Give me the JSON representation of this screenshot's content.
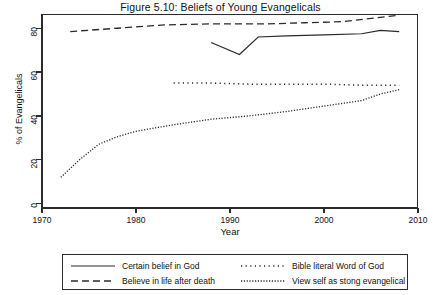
{
  "figure": {
    "title": "Figure 5.10: Beliefs of Young Evangelicals"
  },
  "axes": {
    "xlabel": "Year",
    "ylabel": "% of Evangelicals",
    "xticks": [
      "1970",
      "1980",
      "1990",
      "2000",
      "2010"
    ],
    "yticks": [
      "0",
      "20",
      "40",
      "60",
      "80"
    ]
  },
  "legend": {
    "entries": [
      {
        "label": "Certain belief in God",
        "style": "solid"
      },
      {
        "label": "Believe in life after death",
        "style": "dashed"
      },
      {
        "label": "Bible literal Word of God",
        "style": "sparse-dotted"
      },
      {
        "label": "View self as stong evangelical",
        "style": "dense-dotted"
      }
    ]
  },
  "chart_data": {
    "type": "line",
    "title": "Figure 5.10: Beliefs of Young Evangelicals",
    "xlabel": "Year",
    "ylabel": "% of Evangelicals",
    "xlim": [
      1970,
      2010
    ],
    "ylim": [
      0,
      80
    ],
    "xticks": [
      1970,
      1980,
      1990,
      2000,
      2010
    ],
    "yticks": [
      0,
      20,
      40,
      60,
      80
    ],
    "grid": false,
    "legend_position": "below-plot",
    "series": [
      {
        "name": "Certain belief in God",
        "style": "solid",
        "color": "#2b2b2b",
        "x": [
          1988,
          1991,
          1993,
          1996,
          2000,
          2004,
          2006,
          2008
        ],
        "y": [
          73.5,
          68.0,
          76.0,
          76.5,
          77.0,
          77.5,
          79.0,
          78.5
        ]
      },
      {
        "name": "Believe in life after death",
        "style": "dashed",
        "color": "#2b2b2b",
        "x": [
          1973,
          1978,
          1983,
          1988,
          1991,
          1994,
          1998,
          2002,
          2006,
          2008
        ],
        "y": [
          78.5,
          80.0,
          81.5,
          82.0,
          82.0,
          82.0,
          82.5,
          83.0,
          85.0,
          86.0
        ]
      },
      {
        "name": "Bible literal Word of God",
        "style": "sparse-dotted",
        "color": "#2b2b2b",
        "x": [
          1984,
          1988,
          1992,
          1996,
          2000,
          2004,
          2008
        ],
        "y": [
          55.0,
          55.0,
          54.5,
          54.5,
          54.5,
          54.0,
          54.0
        ]
      },
      {
        "name": "View self as stong evangelical",
        "style": "dense-dotted",
        "color": "#2b2b2b",
        "x": [
          1972,
          1974,
          1976,
          1978,
          1980,
          1984,
          1988,
          1992,
          1996,
          2000,
          2004,
          2006,
          2008
        ],
        "y": [
          12.0,
          20.0,
          27.0,
          30.5,
          33.0,
          36.0,
          38.5,
          40.0,
          42.0,
          44.5,
          47.0,
          50.0,
          52.0
        ]
      }
    ]
  }
}
